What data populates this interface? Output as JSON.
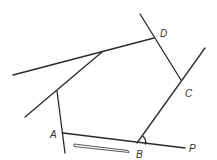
{
  "diagram": {
    "labels": {
      "A": "A",
      "B": "B",
      "C": "C",
      "D": "D",
      "P": "P"
    },
    "colors": {
      "line": "#2a2a2a",
      "label": "#333333",
      "background": "#ffffff"
    },
    "annotations": {
      "angle_mark_at": "B",
      "arrow_direction": "A to B"
    }
  }
}
